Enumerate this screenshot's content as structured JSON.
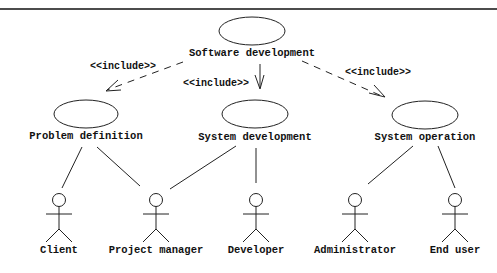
{
  "diagram": {
    "type": "uml-use-case",
    "use_cases": [
      {
        "id": "sw",
        "label": "Software development"
      },
      {
        "id": "pd",
        "label": "Problem definition"
      },
      {
        "id": "sd",
        "label": "System development"
      },
      {
        "id": "so",
        "label": "System operation"
      }
    ],
    "actors": [
      {
        "id": "client",
        "label": "Client"
      },
      {
        "id": "pm",
        "label": "Project manager"
      },
      {
        "id": "dev",
        "label": "Developer"
      },
      {
        "id": "admin",
        "label": "Administrator"
      },
      {
        "id": "enduser",
        "label": "End user"
      }
    ],
    "includes": [
      {
        "from": "sw",
        "to": "pd",
        "label": "<<include>>"
      },
      {
        "from": "sw",
        "to": "sd",
        "label": "<<include>>"
      },
      {
        "from": "sw",
        "to": "so",
        "label": "<<include>>"
      }
    ],
    "associations": [
      {
        "use_case": "pd",
        "actor": "client"
      },
      {
        "use_case": "pd",
        "actor": "pm"
      },
      {
        "use_case": "sd",
        "actor": "pm"
      },
      {
        "use_case": "sd",
        "actor": "dev"
      },
      {
        "use_case": "so",
        "actor": "admin"
      },
      {
        "use_case": "so",
        "actor": "enduser"
      }
    ]
  }
}
